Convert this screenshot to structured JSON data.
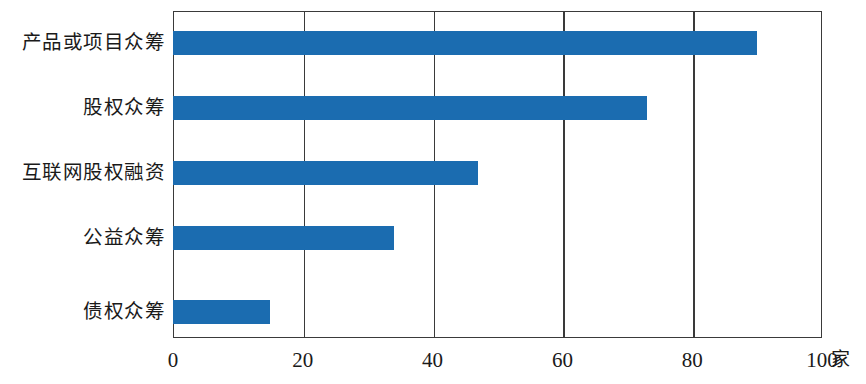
{
  "chart_data": {
    "type": "bar",
    "orientation": "horizontal",
    "title": "",
    "subtitle": "",
    "xlabel": "家",
    "ylabel": "",
    "categories": [
      "产品或项目众筹",
      "股权众筹",
      "互联网股权融资",
      "公益众筹",
      "债权众筹"
    ],
    "values": [
      90,
      73,
      47,
      34,
      15
    ],
    "xlim": [
      0,
      100
    ],
    "xticks": [
      0,
      20,
      40,
      60,
      80,
      100
    ],
    "xtick_labels": [
      "0",
      "20",
      "40",
      "60",
      "80",
      "100"
    ],
    "grid": "vertical-only",
    "legend": "none",
    "series": [
      {
        "name": "数量",
        "color": "#1b6cb0",
        "values": [
          90,
          73,
          47,
          34,
          15
        ]
      }
    ]
  },
  "colors": {
    "bar": "#1b6cb0",
    "axis": "#3a3a3a",
    "text": "#1a1a1a",
    "background": "#ffffff"
  },
  "axis": {
    "unit_label": "家"
  }
}
